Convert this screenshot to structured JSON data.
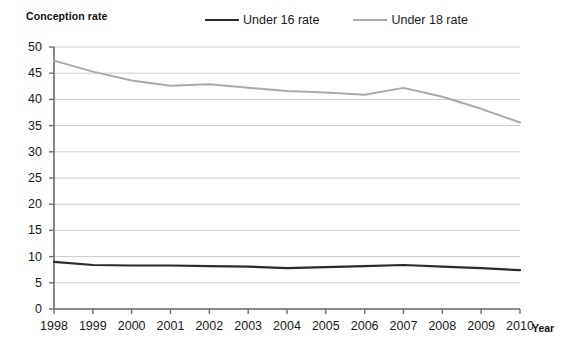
{
  "chart_data": {
    "type": "line",
    "title": "",
    "ylabel": "Conception rate",
    "xlabel": "Year",
    "x": [
      1998,
      1999,
      2000,
      2001,
      2002,
      2003,
      2004,
      2005,
      2006,
      2007,
      2008,
      2009,
      2010
    ],
    "categories": [
      "1998",
      "1999",
      "2000",
      "2001",
      "2002",
      "2003",
      "2004",
      "2005",
      "2006",
      "2007",
      "2008",
      "2009",
      "2010"
    ],
    "series": [
      {
        "name": "Under 16 rate",
        "color": "#2b2b2b",
        "values": [
          9.0,
          8.4,
          8.3,
          8.3,
          8.2,
          8.1,
          7.8,
          8.0,
          8.2,
          8.4,
          8.1,
          7.8,
          7.4
        ]
      },
      {
        "name": "Under 18 rate",
        "color": "#aaaaaa",
        "values": [
          47.4,
          45.3,
          43.6,
          42.6,
          42.9,
          42.2,
          41.6,
          41.3,
          40.9,
          42.2,
          40.5,
          38.2,
          35.6
        ]
      }
    ],
    "ylim": [
      0,
      50
    ],
    "yticks": [
      0,
      5,
      10,
      15,
      20,
      25,
      30,
      35,
      40,
      45,
      50
    ],
    "ytick_labels": [
      "0",
      "5",
      "10",
      "15",
      "20",
      "25",
      "30",
      "35",
      "40",
      "45",
      "50"
    ],
    "xlim": [
      1998,
      2010
    ],
    "grid": "horizontal",
    "grid_color": "#cccccc",
    "legend_position": "top"
  },
  "legend": {
    "items": [
      {
        "label": "Under 16 rate",
        "swatch": "line-swatch-dark"
      },
      {
        "label": "Under 18 rate",
        "swatch": "line-swatch-gray"
      }
    ]
  },
  "axes": {
    "y_title": "Conception rate",
    "x_title": "Year"
  }
}
